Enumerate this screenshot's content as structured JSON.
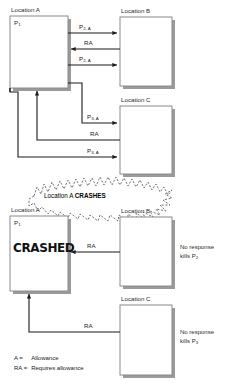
{
  "diagram": {
    "legend": [
      {
        "key": "A =",
        "text": "Allowance"
      },
      {
        "key": "RA =",
        "text": "Requires allowance"
      }
    ],
    "burst": {
      "prefix": "Location A ",
      "emphasis": "CRASHES"
    },
    "crashed_stamp": "CRASHED"
  },
  "boxes": {
    "a_top": {
      "title": "Location A",
      "process": "P",
      "process_sub": "1"
    },
    "b_top": {
      "title": "Location B"
    },
    "c_top": {
      "title": "Location C"
    },
    "a_bottom": {
      "title": "Location A",
      "process": "P",
      "process_sub": "1"
    },
    "b_bottom": {
      "title": "Location B"
    },
    "c_bottom": {
      "title": "Location C"
    }
  },
  "edges": {
    "top_group": [
      {
        "base": "P",
        "sub": "2, A",
        "direction": "right"
      },
      {
        "base": "RA",
        "sub": "",
        "direction": "left"
      },
      {
        "base": "P",
        "sub": "2, A",
        "direction": "right"
      }
    ],
    "mid_group": [
      {
        "base": "P",
        "sub": "3, A",
        "direction": "right"
      },
      {
        "base": "RA",
        "sub": "",
        "direction": "left"
      },
      {
        "base": "P",
        "sub": "3, A",
        "direction": "right"
      }
    ],
    "bottom_group": [
      {
        "base": "RA",
        "sub": "",
        "direction": "left"
      },
      {
        "base": "RA",
        "sub": "",
        "direction": "left"
      }
    ]
  },
  "notes": [
    {
      "line1": "No response",
      "line2_prefix": "kills P",
      "line2_sub": "2"
    },
    {
      "line1": "No response",
      "line2_prefix": "kills P",
      "line2_sub": "3"
    }
  ],
  "colors": {
    "stroke": "#1a1a1a",
    "box_border": "#8a8a8a",
    "box_fill": "#ffffff",
    "shadow": "#9a9a9a",
    "text": "#2b2b2b",
    "burst_stroke": "#4a4a4a"
  }
}
